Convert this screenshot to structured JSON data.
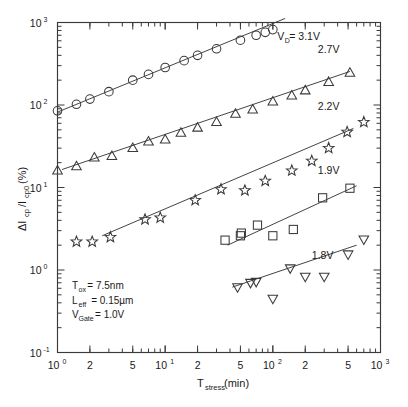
{
  "chart_data": {
    "type": "scatter",
    "title": "",
    "subtitle": "",
    "xlabel": "T",
    "xlabel_sub": "stress",
    "xlabel_unit": " (min)",
    "xlabel_full": "Tstress (min)",
    "ylabel_full": "ΔIcp/Icp0 (%)",
    "ylabel_parts": {
      "delta": "ΔI",
      "sub1": "cp",
      "slash": "/I",
      "sub2": "cp0",
      "unit": " (%)"
    },
    "xscale": "log",
    "yscale": "log",
    "xlim": [
      1,
      1000
    ],
    "ylim": [
      0.1,
      1000
    ],
    "grid": false,
    "legend_position": "inline-right",
    "x_tick_labels": [
      {
        "value": 1,
        "mantissa": "10",
        "exponent": "0"
      },
      {
        "value": 2,
        "mantissa": "2",
        "exponent": ""
      },
      {
        "value": 5,
        "mantissa": "5",
        "exponent": ""
      },
      {
        "value": 10,
        "mantissa": "10",
        "exponent": "1"
      },
      {
        "value": 20,
        "mantissa": "2",
        "exponent": ""
      },
      {
        "value": 50,
        "mantissa": "5",
        "exponent": ""
      },
      {
        "value": 100,
        "mantissa": "10",
        "exponent": "2"
      },
      {
        "value": 200,
        "mantissa": "2",
        "exponent": ""
      },
      {
        "value": 500,
        "mantissa": "5",
        "exponent": ""
      },
      {
        "value": 1000,
        "mantissa": "10",
        "exponent": "3"
      }
    ],
    "y_tick_labels": [
      {
        "value": 0.1,
        "mantissa": "10",
        "exponent": "-1"
      },
      {
        "value": 1,
        "mantissa": "10",
        "exponent": "0"
      },
      {
        "value": 10,
        "mantissa": "10",
        "exponent": "1"
      },
      {
        "value": 100,
        "mantissa": "10",
        "exponent": "2"
      },
      {
        "value": 1000,
        "mantissa": "10",
        "exponent": "3"
      }
    ],
    "series": [
      {
        "name": "VD = 3.1V",
        "label": "V",
        "label_sub": "D",
        "label_rest": " = 3.1V",
        "marker": "circle",
        "label_x": 110,
        "label_y": 620,
        "fit": {
          "x0": 1.0,
          "y0": 82,
          "x1": 130,
          "y1": 1120
        },
        "points": [
          {
            "x": 1.0,
            "y": 85
          },
          {
            "x": 1.5,
            "y": 102
          },
          {
            "x": 2.0,
            "y": 118
          },
          {
            "x": 3.0,
            "y": 145
          },
          {
            "x": 5.0,
            "y": 200
          },
          {
            "x": 7.0,
            "y": 235
          },
          {
            "x": 10.0,
            "y": 285
          },
          {
            "x": 15.0,
            "y": 345
          },
          {
            "x": 20.0,
            "y": 400
          },
          {
            "x": 30.0,
            "y": 480
          },
          {
            "x": 50.0,
            "y": 610
          },
          {
            "x": 70.0,
            "y": 700
          },
          {
            "x": 85.0,
            "y": 760
          },
          {
            "x": 100.0,
            "y": 820
          },
          {
            "x": 130.0,
            "y": 1100
          }
        ]
      },
      {
        "name": "2.7V",
        "label": "2.7V",
        "marker": "triangle-up",
        "label_x": 330,
        "label_y": 430,
        "fit": {
          "x0": 1.1,
          "y0": 16.5,
          "x1": 520,
          "y1": 255
        },
        "points": [
          {
            "x": 1.0,
            "y": 16
          },
          {
            "x": 1.5,
            "y": 18
          },
          {
            "x": 2.2,
            "y": 23
          },
          {
            "x": 3.2,
            "y": 24
          },
          {
            "x": 5.0,
            "y": 30
          },
          {
            "x": 7.0,
            "y": 36
          },
          {
            "x": 10.0,
            "y": 38
          },
          {
            "x": 14.0,
            "y": 46
          },
          {
            "x": 20.0,
            "y": 53
          },
          {
            "x": 30.0,
            "y": 62
          },
          {
            "x": 45.0,
            "y": 78
          },
          {
            "x": 65.0,
            "y": 88
          },
          {
            "x": 100.0,
            "y": 110
          },
          {
            "x": 150.0,
            "y": 130
          },
          {
            "x": 200.0,
            "y": 150
          },
          {
            "x": 330.0,
            "y": 190
          },
          {
            "x": 520.0,
            "y": 245
          }
        ]
      },
      {
        "name": "2.2V",
        "label": "2.2V",
        "marker": "star",
        "label_x": 330,
        "label_y": 88,
        "fit": {
          "x0": 2.6,
          "y0": 2.6,
          "x1": 560,
          "y1": 52
        },
        "points": [
          {
            "x": 1.5,
            "y": 2.2
          },
          {
            "x": 2.1,
            "y": 2.2
          },
          {
            "x": 3.1,
            "y": 2.5
          },
          {
            "x": 6.5,
            "y": 4.1
          },
          {
            "x": 9.0,
            "y": 4.3
          },
          {
            "x": 19.0,
            "y": 7.0
          },
          {
            "x": 33.0,
            "y": 9.5
          },
          {
            "x": 55.0,
            "y": 9.2
          },
          {
            "x": 85.0,
            "y": 12.0
          },
          {
            "x": 150.0,
            "y": 16.0
          },
          {
            "x": 230.0,
            "y": 21.0
          },
          {
            "x": 330.0,
            "y": 30.0
          },
          {
            "x": 490.0,
            "y": 47.0
          },
          {
            "x": 700.0,
            "y": 62.0
          }
        ]
      },
      {
        "name": "1.9V",
        "label": "1.9V",
        "marker": "square",
        "label_x": 330,
        "label_y": 14.5,
        "fit": {
          "x0": 38,
          "y0": 2.0,
          "x1": 600,
          "y1": 10.5
        },
        "points": [
          {
            "x": 36.0,
            "y": 2.3
          },
          {
            "x": 50.0,
            "y": 2.6
          },
          {
            "x": 51.0,
            "y": 2.8
          },
          {
            "x": 72.0,
            "y": 3.5
          },
          {
            "x": 100.0,
            "y": 2.6
          },
          {
            "x": 155.0,
            "y": 3.1
          },
          {
            "x": 290.0,
            "y": 7.5
          },
          {
            "x": 520.0,
            "y": 9.8
          }
        ]
      },
      {
        "name": "1.8V",
        "label": "1.8V",
        "marker": "triangle-down",
        "label_x": 290,
        "label_y": 1.35,
        "fit": {
          "x0": 42,
          "y0": 0.62,
          "x1": 600,
          "y1": 2.0
        },
        "points": [
          {
            "x": 47.0,
            "y": 0.62
          },
          {
            "x": 62.0,
            "y": 0.7
          },
          {
            "x": 70.0,
            "y": 0.72
          },
          {
            "x": 100.0,
            "y": 0.45
          },
          {
            "x": 145.0,
            "y": 1.05
          },
          {
            "x": 200.0,
            "y": 0.83
          },
          {
            "x": 300.0,
            "y": 0.83
          },
          {
            "x": 500.0,
            "y": 1.55
          },
          {
            "x": 700.0,
            "y": 2.35
          }
        ]
      }
    ],
    "annotations": [
      {
        "text": "T",
        "sub": "ox",
        "rest": " = 7.5nm",
        "full": "Tox = 7.5nm"
      },
      {
        "text": "L",
        "sub": "eff",
        "rest": " = 0.15µm",
        "full": "Leff = 0.15µm"
      },
      {
        "text": "V",
        "sub": "Gate",
        "rest": " = 1.0V",
        "full": "VGate = 1.0V"
      }
    ]
  },
  "colors": {
    "background": "#ffffff",
    "axis": "#3a3a3a",
    "text": "#1a1a1a",
    "marker": "#3a3a3a"
  }
}
